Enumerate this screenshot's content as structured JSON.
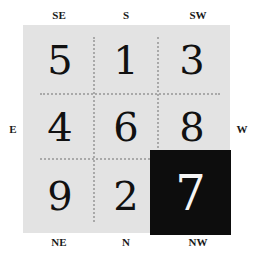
{
  "directions": {
    "top": [
      "SE",
      "S",
      "SW"
    ],
    "left": "E",
    "right": "W",
    "bottom": [
      "NE",
      "N",
      "NW"
    ]
  },
  "grid": {
    "rows": [
      [
        "5",
        "1",
        "3"
      ],
      [
        "4",
        "6",
        "8"
      ],
      [
        "9",
        "2",
        "7"
      ]
    ],
    "highlighted_cell": {
      "row": 2,
      "col": 2,
      "value": "7"
    },
    "colors": {
      "background": "#e3e3e3",
      "dotted_lines": "#a9a9a9",
      "highlight_bg": "#0d0d0d",
      "highlight_text": "#f5f5f5",
      "text": "#111111"
    }
  }
}
